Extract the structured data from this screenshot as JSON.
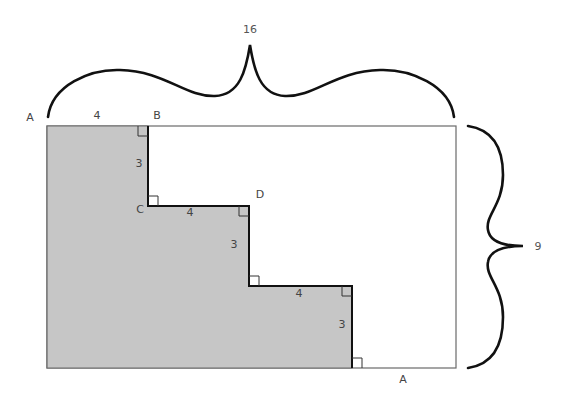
{
  "diagram": {
    "type": "geometry-figure",
    "colors": {
      "shade": "#c4c4c4",
      "outline": "#666666",
      "staircase": "#111111",
      "brace": "#111111",
      "text": "#444444"
    },
    "dimensions": {
      "width_label": "16",
      "height_label": "9"
    },
    "points": {
      "top_left": "A",
      "top_step": "B",
      "inner_corner": "C",
      "outer_corner": "D",
      "bottom_right_step": "A"
    },
    "segments": {
      "A_to_B": "4",
      "B_to_C": "3",
      "C_to_D": "4",
      "D_down": "3",
      "step2_horizontal": "4",
      "step2_vertical": "3"
    }
  }
}
